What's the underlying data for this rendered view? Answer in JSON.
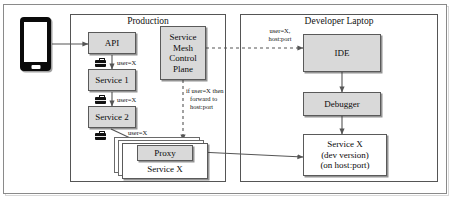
{
  "diagram": {
    "groups": [
      {
        "id": "production",
        "label": "Production"
      },
      {
        "id": "developer_laptop",
        "label": "Developer Laptop"
      }
    ],
    "nodes": [
      {
        "id": "phone",
        "label": "",
        "style": "phone"
      },
      {
        "id": "api",
        "label": "API",
        "style": "gray"
      },
      {
        "id": "service1",
        "label": "Service 1",
        "style": "gray"
      },
      {
        "id": "service2",
        "label": "Service 2",
        "style": "gray"
      },
      {
        "id": "mesh",
        "label": "Service\nMesh\nControl\nPlane",
        "style": "gray"
      },
      {
        "id": "proxy",
        "label": "Proxy",
        "style": "gray"
      },
      {
        "id": "servicex",
        "label": "Service X",
        "style": "white"
      },
      {
        "id": "ide",
        "label": "IDE",
        "style": "gray"
      },
      {
        "id": "debugger",
        "label": "Debugger",
        "style": "gray"
      },
      {
        "id": "servicex_dev",
        "label": "Service X\n(dev version)\n(on host:port)",
        "style": "white"
      }
    ],
    "labels": {
      "api_to_service1": "user=X",
      "service1_to_service2": "user=X",
      "service2_to_proxy": "user=X",
      "mesh_rule": "if user=X then\n  forward to\n  host:port",
      "mesh_to_ide": "user=X,\nhost:port"
    },
    "node_text": {
      "api": "API",
      "service1": "Service 1",
      "service2": "Service 2",
      "mesh_line1": "Service",
      "mesh_line2": "Mesh",
      "mesh_line3": "Control",
      "mesh_line4": "Plane",
      "proxy": "Proxy",
      "servicex": "Service X",
      "ide": "IDE",
      "debugger": "Debugger",
      "servicex_dev_line1": "Service X",
      "servicex_dev_line2": "(dev version)",
      "servicex_dev_line3": "(on host:port)"
    },
    "rule_text": {
      "line1": "if user=X then",
      "line2": "forward to",
      "line3": "host:port"
    },
    "mesh_to_ide_text": {
      "line1": "user=X,",
      "line2": "host:port"
    },
    "colors": {
      "node_fill_gray": "#d9d9d9",
      "node_fill_white": "#ffffff",
      "border": "#5a5a5a",
      "group_border": "#555555",
      "text": "#0b0b0b",
      "phone_body": "#0a0a0a",
      "edge": "#555555"
    }
  }
}
